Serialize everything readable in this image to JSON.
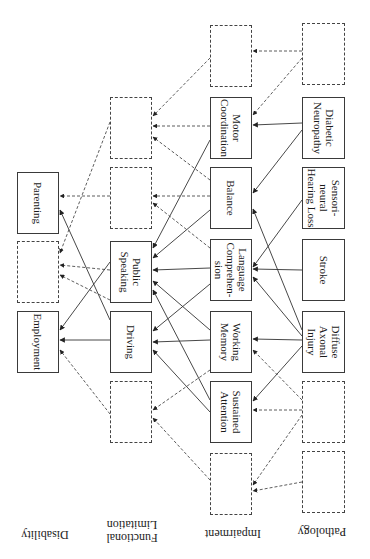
{
  "figure": {
    "type": "disablement-model-diagram",
    "orientation": "rotated-90-degrees",
    "levels": [
      {
        "key": "disability",
        "label": "Disability"
      },
      {
        "key": "functional",
        "label": "Functional\nLimitation"
      },
      {
        "key": "impairment",
        "label": "Impairment"
      },
      {
        "key": "pathology",
        "label": "Pathology"
      }
    ],
    "nodes": {
      "disability": [
        {
          "id": "parenting",
          "label": "Parenting",
          "style": "solid"
        },
        {
          "id": "dis_blank1",
          "label": "",
          "style": "dashed"
        },
        {
          "id": "employment",
          "label": "Employment",
          "style": "solid"
        }
      ],
      "functional": [
        {
          "id": "fl_blank1",
          "label": "",
          "style": "dashed"
        },
        {
          "id": "fl_blank2",
          "label": "",
          "style": "dashed"
        },
        {
          "id": "public_speaking",
          "label": "Public\nSpeaking",
          "style": "solid"
        },
        {
          "id": "driving",
          "label": "Driving",
          "style": "solid"
        },
        {
          "id": "fl_blank3",
          "label": "",
          "style": "dashed"
        }
      ],
      "impairment": [
        {
          "id": "imp_blank1",
          "label": "",
          "style": "dashed"
        },
        {
          "id": "motor",
          "label": "Motor\nCoordination",
          "style": "solid"
        },
        {
          "id": "balance",
          "label": "Balance",
          "style": "solid"
        },
        {
          "id": "language",
          "label": "Language\nComprehen-\nsion",
          "style": "solid"
        },
        {
          "id": "working_memory",
          "label": "Working\nMemory",
          "style": "solid"
        },
        {
          "id": "sustained_attention",
          "label": "Sustained\nAttention",
          "style": "solid"
        },
        {
          "id": "imp_blank2",
          "label": "",
          "style": "dashed"
        }
      ],
      "pathology": [
        {
          "id": "path_blank1",
          "label": "",
          "style": "dashed"
        },
        {
          "id": "diabetic",
          "label": "Diabetic\nNeuropathy",
          "style": "solid"
        },
        {
          "id": "sensorineural",
          "label": "Sensori-\nneural\nHearing Loss",
          "style": "solid"
        },
        {
          "id": "stroke",
          "label": "Stroke",
          "style": "solid"
        },
        {
          "id": "dai",
          "label": "Diffuse\nAxonal\nInjury",
          "style": "solid"
        },
        {
          "id": "path_blank2",
          "label": "",
          "style": "dashed"
        },
        {
          "id": "path_blank3",
          "label": "",
          "style": "dashed"
        }
      ]
    }
  }
}
